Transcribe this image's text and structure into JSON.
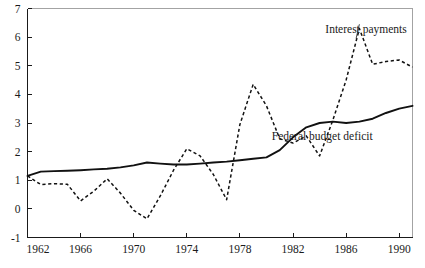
{
  "chart_data": {
    "type": "line",
    "title": "",
    "subtitle": "",
    "xlabel": "",
    "ylabel": "",
    "xlim": [
      1962,
      1991
    ],
    "ylim": [
      -1,
      7
    ],
    "xticks": [
      1962,
      1966,
      1970,
      1974,
      1978,
      1982,
      1986,
      1990
    ],
    "xtick_labels": [
      "1962",
      "1966",
      "1970",
      "1974",
      "1978",
      "1982",
      "1986",
      "1990"
    ],
    "yticks": [
      -1,
      0,
      1,
      2,
      3,
      4,
      5,
      6,
      7
    ],
    "ytick_labels": [
      "-1",
      "0",
      "1",
      "2",
      "3",
      "4",
      "5",
      "6",
      "7"
    ],
    "grid": false,
    "legend_position": "inline-annotation",
    "x": [
      1962,
      1963,
      1964,
      1965,
      1966,
      1967,
      1968,
      1969,
      1970,
      1971,
      1972,
      1973,
      1974,
      1975,
      1976,
      1977,
      1978,
      1979,
      1980,
      1981,
      1982,
      1983,
      1984,
      1985,
      1986,
      1987,
      1988,
      1989,
      1990,
      1991
    ],
    "series": [
      {
        "name": "Interest payments",
        "style": "dashed",
        "color": "#111111",
        "values": [
          1.15,
          0.85,
          0.88,
          0.86,
          0.28,
          0.62,
          1.05,
          0.55,
          -0.05,
          -0.35,
          0.45,
          1.35,
          2.1,
          1.85,
          1.2,
          0.32,
          2.95,
          4.35,
          3.6,
          2.45,
          2.3,
          2.55,
          1.85,
          3.1,
          4.5,
          6.3,
          5.05,
          5.15,
          5.2,
          4.95
        ],
        "annotation": {
          "text": "Interest payments",
          "x": 1987.5,
          "y": 6.15
        }
      },
      {
        "name": "Federal budget deficit",
        "style": "solid",
        "color": "#111111",
        "values": [
          1.15,
          1.3,
          1.32,
          1.33,
          1.35,
          1.38,
          1.4,
          1.45,
          1.52,
          1.62,
          1.58,
          1.55,
          1.55,
          1.58,
          1.62,
          1.65,
          1.7,
          1.75,
          1.8,
          2.05,
          2.5,
          2.85,
          3.0,
          3.05,
          3.0,
          3.05,
          3.15,
          3.35,
          3.5,
          3.6
        ],
        "annotation": {
          "text": "Federal budget deficit",
          "x": 1984.2,
          "y": 2.42
        }
      }
    ],
    "axis": {
      "left_visible": true,
      "bottom_visible": true,
      "top_visible": true,
      "right_visible": true
    }
  }
}
